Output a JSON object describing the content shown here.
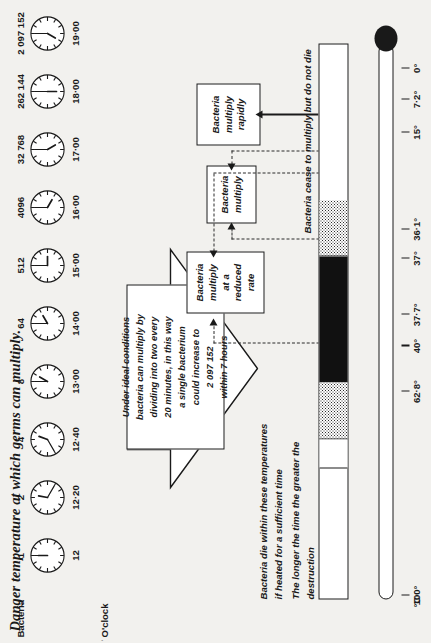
{
  "title": "Danger temperature at which germs can multiply.",
  "thermometer": {
    "unit_label": "°C",
    "scale": [
      {
        "value": "100°",
        "pos": 0.0
      },
      {
        "value": "62·8°",
        "pos": 0.372
      },
      {
        "value": "40°",
        "pos": 0.455
      },
      {
        "value": "37·7°",
        "pos": 0.512
      },
      {
        "value": "37°",
        "pos": 0.615
      },
      {
        "value": "36·1°",
        "pos": 0.668
      },
      {
        "value": "15°",
        "pos": 0.845
      },
      {
        "value": "7·2°",
        "pos": 0.905
      },
      {
        "value": "0°",
        "pos": 0.962
      }
    ],
    "annotations": {
      "kill_zone": "Bacteria die within these temperatures\nif heated for a sufficient time",
      "kill_zone_2": "The longer the time the greater the\ndestruction",
      "cold_zone": "Bacteria cease to multiply but do not die"
    }
  },
  "boxes": [
    {
      "id": "rapid",
      "label": "Bacteria\nmultiply\nrapidly"
    },
    {
      "id": "normal",
      "label": "Bacteria\nmultiply"
    },
    {
      "id": "reduced",
      "label": "Bacteria\nmultiply\nat a\nreduced\nrate"
    }
  ],
  "callout": {
    "note": "Under ideal conditions\nbacteria can multiply by\ndividing into two every\n20 minutes, in this way\na single bacterium\ncould increase to\n2 097 152\nwithin 7 hours"
  },
  "clock_table": {
    "header_time": "O'clock",
    "header_bacteria": "Bacteria",
    "rows": [
      {
        "time": "12",
        "bacteria": "1",
        "hour": 12,
        "minute": 0
      },
      {
        "time": "12·20",
        "bacteria": "2",
        "hour": 12,
        "minute": 20
      },
      {
        "time": "12·40",
        "bacteria": "4",
        "hour": 12,
        "minute": 40
      },
      {
        "time": "13·00",
        "bacteria": "8",
        "hour": 1,
        "minute": 0
      },
      {
        "time": "14·00",
        "bacteria": "64",
        "hour": 2,
        "minute": 0
      },
      {
        "time": "15·00",
        "bacteria": "512",
        "hour": 3,
        "minute": 0
      },
      {
        "time": "16·00",
        "bacteria": "4096",
        "hour": 4,
        "minute": 0
      },
      {
        "time": "17·00",
        "bacteria": "32 768",
        "hour": 5,
        "minute": 0
      },
      {
        "time": "18·00",
        "bacteria": "262 144",
        "hour": 6,
        "minute": 0
      },
      {
        "time": "19·00",
        "bacteria": "2 097 152",
        "hour": 7,
        "minute": 0
      }
    ]
  },
  "colors": {
    "ink": "#1a1a1a",
    "paper": "#f2f1ee"
  }
}
